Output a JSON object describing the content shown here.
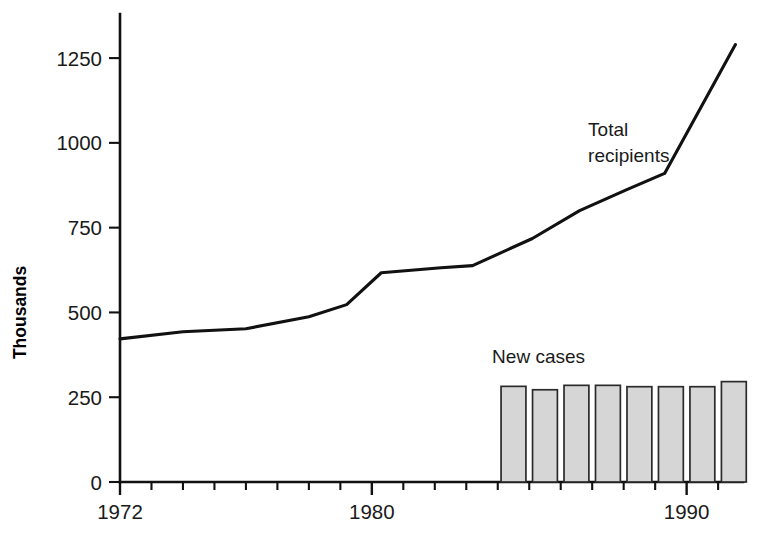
{
  "chart_data": {
    "type": "line",
    "title": "",
    "subtitle": "",
    "xlabel": "",
    "ylabel": "Thousands",
    "xlim": [
      1972,
      1991.6
    ],
    "ylim": [
      0,
      1380
    ],
    "grid": false,
    "legend_position": "inline-annotation",
    "y_ticks": [
      0,
      250,
      500,
      750,
      1000,
      1250
    ],
    "y_tick_labels": [
      "0",
      "250",
      "500",
      "750",
      "1000",
      "1250"
    ],
    "x_ticks": [
      1972,
      1973,
      1974,
      1975,
      1976,
      1977,
      1978,
      1979,
      1980,
      1981,
      1982,
      1983,
      1984,
      1985,
      1986,
      1987,
      1988,
      1989,
      1990,
      1991
    ],
    "x_tick_labels_shown": [
      "1972",
      "1980",
      "1990"
    ],
    "x_labeled_ticks": [
      1972,
      1980,
      1990
    ],
    "series": [
      {
        "name": "Total recipients",
        "type": "line",
        "annotation": "Total recipients",
        "annotation_line1": "Total",
        "annotation_line2": "recipients",
        "annotation_x": 1991.0,
        "annotation_y": 1020,
        "color": "#111111",
        "x": [
          1972,
          1973,
          1974,
          1975,
          1976,
          1977,
          1978,
          1979,
          1980,
          1981,
          1982,
          1983,
          1984,
          1985,
          1986,
          1987,
          1988,
          1989,
          1990,
          1991
        ],
        "values": [
          422,
          434,
          441,
          447,
          458,
          478,
          503,
          530,
          562,
          618,
          622,
          636,
          672,
          712,
          760,
          812,
          862,
          905,
          1010,
          1120
        ]
      },
      {
        "name": "New cases",
        "type": "bar",
        "annotation": "New cases",
        "annotation_x": 1985.6,
        "annotation_y": 352,
        "color": "#d6d6d6",
        "edge_color": "#2b2b2b",
        "x": [
          1984,
          1985,
          1986,
          1987,
          1988,
          1989,
          1990,
          1991
        ],
        "values": [
          282,
          272,
          285,
          285,
          281,
          281,
          281,
          296
        ]
      }
    ],
    "line_vertices": {
      "x": [
        1972,
        1974,
        1976,
        1978,
        1979.2,
        1980.3,
        1982.2,
        1983.2,
        1985.1,
        1986.6,
        1988.1,
        1989.3,
        1991.55
      ],
      "y": [
        422,
        443,
        452,
        487,
        523,
        617,
        632,
        638,
        718,
        800,
        862,
        910,
        1290
      ]
    }
  },
  "plot_geometry": {
    "left_px": 120,
    "right_px": 737,
    "top_px": 14,
    "bottom_px": 482,
    "x_min": 1972,
    "x_max": 1991.6,
    "y_min": 0,
    "y_max": 1380
  },
  "labels": {
    "y_axis_title": "Thousands",
    "total_recipients_line1": "Total",
    "total_recipients_line2": "recipients",
    "new_cases": "New cases"
  }
}
